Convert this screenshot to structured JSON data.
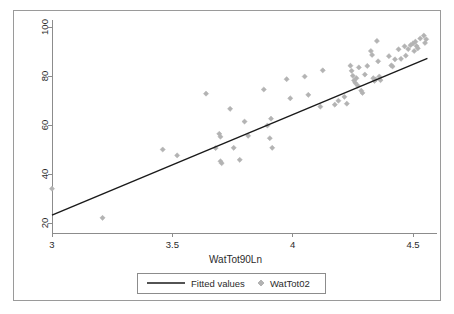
{
  "chart_data": {
    "type": "scatter",
    "title": "",
    "subtitle": "",
    "xlabel": "WatTot90Ln",
    "ylabel": "",
    "xlim": [
      2.92,
      4.62
    ],
    "ylim": [
      17.5,
      103
    ],
    "xticks": [
      3,
      3.5,
      4,
      4.5
    ],
    "xtick_labels": [
      "3",
      "3.5",
      "4",
      "4.5"
    ],
    "yticks": [
      20,
      40,
      60,
      80,
      100
    ],
    "ytick_labels": [
      "20",
      "40",
      "60",
      "80",
      "100"
    ],
    "grid": false,
    "legend_position": "below-axes",
    "legend": [
      {
        "name": "Fitted values",
        "marker": "line",
        "color": "#1a1a1a"
      },
      {
        "name": "WatTot02",
        "marker": "diamond",
        "color": "#b3b3b3"
      }
    ],
    "series": [
      {
        "name": "Fitted values",
        "type": "line",
        "color": "#1a1a1a",
        "x": [
          3.0,
          4.56
        ],
        "y": [
          23.2,
          87.2
        ]
      },
      {
        "name": "WatTot02",
        "type": "scatter",
        "color": "#b3b3b3",
        "marker": "diamond",
        "points": [
          [
            3.0,
            34.0
          ],
          [
            3.21,
            22.1
          ],
          [
            3.46,
            50.0
          ],
          [
            3.52,
            47.6
          ],
          [
            3.64,
            72.8
          ],
          [
            3.68,
            50.6
          ],
          [
            3.695,
            56.4
          ],
          [
            3.7,
            55.2
          ],
          [
            3.7,
            45.2
          ],
          [
            3.705,
            44.4
          ],
          [
            3.74,
            66.6
          ],
          [
            3.755,
            50.7
          ],
          [
            3.78,
            45.8
          ],
          [
            3.8,
            61.4
          ],
          [
            3.815,
            55.6
          ],
          [
            3.88,
            74.5
          ],
          [
            3.895,
            59.8
          ],
          [
            3.905,
            54.6
          ],
          [
            3.91,
            62.6
          ],
          [
            3.915,
            50.7
          ],
          [
            3.975,
            78.7
          ],
          [
            3.99,
            70.9
          ],
          [
            4.05,
            79.8
          ],
          [
            4.065,
            72.3
          ],
          [
            4.115,
            67.5
          ],
          [
            4.125,
            82.3
          ],
          [
            4.175,
            68.3
          ],
          [
            4.19,
            69.9
          ],
          [
            4.215,
            71.5
          ],
          [
            4.225,
            68.7
          ],
          [
            4.24,
            84.2
          ],
          [
            4.245,
            82.1
          ],
          [
            4.25,
            80.1
          ],
          [
            4.255,
            78.2
          ],
          [
            4.26,
            77.2
          ],
          [
            4.265,
            79.1
          ],
          [
            4.27,
            76.1
          ],
          [
            4.275,
            83.5
          ],
          [
            4.285,
            74.0
          ],
          [
            4.29,
            73.1
          ],
          [
            4.3,
            80.6
          ],
          [
            4.31,
            84.1
          ],
          [
            4.325,
            90.2
          ],
          [
            4.33,
            88.6
          ],
          [
            4.335,
            79.1
          ],
          [
            4.34,
            78.0
          ],
          [
            4.345,
            78.6
          ],
          [
            4.35,
            94.3
          ],
          [
            4.355,
            86.0
          ],
          [
            4.36,
            79.8
          ],
          [
            4.365,
            78.3
          ],
          [
            4.4,
            88.1
          ],
          [
            4.41,
            84.3
          ],
          [
            4.415,
            83.9
          ],
          [
            4.425,
            86.8
          ],
          [
            4.44,
            90.9
          ],
          [
            4.45,
            87.0
          ],
          [
            4.465,
            92.1
          ],
          [
            4.47,
            88.3
          ],
          [
            4.48,
            91.0
          ],
          [
            4.49,
            92.6
          ],
          [
            4.5,
            93.3
          ],
          [
            4.505,
            90.2
          ],
          [
            4.51,
            94.0
          ],
          [
            4.515,
            92.2
          ],
          [
            4.52,
            91.3
          ],
          [
            4.53,
            95.3
          ],
          [
            4.545,
            96.5
          ],
          [
            4.55,
            93.5
          ],
          [
            4.555,
            95.0
          ]
        ]
      }
    ]
  },
  "axes": {
    "x_axis_label": "WatTot90Ln"
  },
  "colors": {
    "marker": "#b3b3b3",
    "line": "#1a1a1a",
    "axis": "#8c8c8c",
    "frame": "#9a9a9a",
    "text": "#2b2b2b",
    "background": "#ffffff"
  }
}
